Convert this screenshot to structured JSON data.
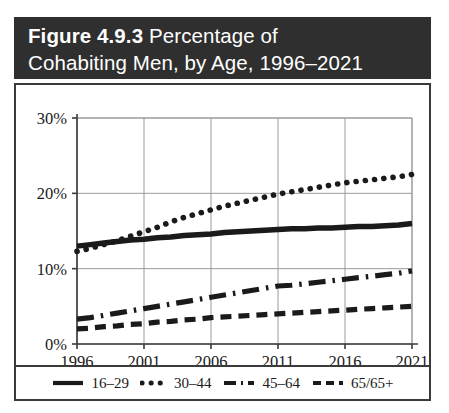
{
  "figure": {
    "number_label": "Figure 4.9.3",
    "title_rest": " Percentage of",
    "title_line2": "Cohabiting Men, by Age, 1996–2021",
    "header_bg": "#2f2f2f",
    "header_fg": "#ffffff",
    "border_color": "#3a3a3a"
  },
  "chart_data": {
    "type": "line",
    "title": "Figure 4.9.3 Percentage of Cohabiting Men, by Age, 1996–2021",
    "xlabel": "",
    "ylabel": "",
    "grid": true,
    "legend_position": "bottom",
    "xlim": [
      1996,
      2021
    ],
    "ylim": [
      0,
      30
    ],
    "xticks": [
      1996,
      2001,
      2006,
      2011,
      2016,
      2021
    ],
    "xtick_labels": [
      "1996",
      "2001",
      "2006",
      "2011",
      "2016",
      "2021"
    ],
    "yticks": [
      0,
      10,
      20,
      30
    ],
    "ytick_labels": [
      "0%",
      "10%",
      "20%",
      "30%"
    ],
    "x": [
      1996,
      1997,
      1998,
      1999,
      2000,
      2001,
      2002,
      2003,
      2004,
      2005,
      2006,
      2007,
      2008,
      2009,
      2010,
      2011,
      2012,
      2013,
      2014,
      2015,
      2016,
      2017,
      2018,
      2019,
      2020,
      2021
    ],
    "series": [
      {
        "name": "16–29",
        "style": "solid",
        "color": "#1a1a1a",
        "values": [
          13.0,
          13.2,
          13.4,
          13.6,
          13.8,
          13.9,
          14.1,
          14.2,
          14.4,
          14.5,
          14.6,
          14.8,
          14.9,
          15.0,
          15.1,
          15.2,
          15.3,
          15.3,
          15.4,
          15.4,
          15.5,
          15.6,
          15.6,
          15.7,
          15.8,
          16.0
        ]
      },
      {
        "name": "30–44",
        "style": "dotted",
        "color": "#1a1a1a",
        "values": [
          12.3,
          12.7,
          13.2,
          13.7,
          14.3,
          14.9,
          15.5,
          16.2,
          16.8,
          17.3,
          17.8,
          18.3,
          18.7,
          19.1,
          19.5,
          19.9,
          20.2,
          20.5,
          20.8,
          21.1,
          21.4,
          21.6,
          21.8,
          22.0,
          22.2,
          22.5
        ]
      },
      {
        "name": "45–64",
        "style": "dashdot",
        "color": "#1a1a1a",
        "values": [
          3.3,
          3.5,
          3.8,
          4.1,
          4.4,
          4.7,
          5.0,
          5.3,
          5.6,
          5.9,
          6.2,
          6.5,
          6.8,
          7.1,
          7.4,
          7.7,
          7.8,
          8.0,
          8.2,
          8.4,
          8.6,
          8.8,
          9.0,
          9.2,
          9.4,
          9.7
        ]
      },
      {
        "name": "65/65+",
        "style": "dashed",
        "color": "#1a1a1a",
        "values": [
          2.0,
          2.1,
          2.3,
          2.4,
          2.6,
          2.7,
          2.9,
          3.0,
          3.2,
          3.3,
          3.5,
          3.6,
          3.7,
          3.8,
          3.9,
          4.0,
          4.1,
          4.2,
          4.3,
          4.4,
          4.5,
          4.6,
          4.7,
          4.8,
          4.9,
          5.0
        ]
      }
    ]
  },
  "legend": {
    "items": [
      {
        "label": "16–29",
        "style": "solid"
      },
      {
        "label": "30–44",
        "style": "dotted"
      },
      {
        "label": "45–64",
        "style": "dashdot"
      },
      {
        "label": "65/65+",
        "style": "dashed"
      }
    ]
  }
}
